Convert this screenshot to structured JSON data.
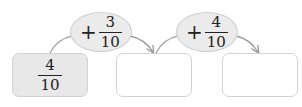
{
  "diagram": {
    "start_value": {
      "numerator": "4",
      "denominator": "10"
    },
    "steps": [
      {
        "operator": "+",
        "numerator": "3",
        "denominator": "10"
      },
      {
        "operator": "+",
        "numerator": "4",
        "denominator": "10"
      }
    ],
    "result_boxes": [
      {
        "value": ""
      },
      {
        "value": ""
      }
    ],
    "colors": {
      "oval_fill": "#ebebeb",
      "start_box_fill": "#e8e8e8",
      "border": "#d2d2d2",
      "arrow": "#999999"
    }
  }
}
